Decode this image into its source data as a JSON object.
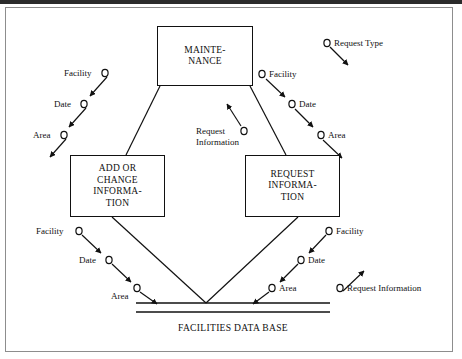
{
  "diagram": {
    "title_text": "FACILITIES DATA BASE",
    "processes": [
      {
        "id": "maintenance",
        "lines": [
          "MAINTE-",
          "NANCE"
        ]
      },
      {
        "id": "add_or_change",
        "lines": [
          "ADD OR",
          "CHANGE",
          "INFORMA-",
          "TION"
        ]
      },
      {
        "id": "request_info",
        "lines": [
          "REQUEST",
          "INFORMA-",
          "TION"
        ]
      }
    ],
    "datastore": {
      "label": "FACILITIES DATA BASE"
    },
    "flows": {
      "top_left": [
        {
          "label": "Facility"
        },
        {
          "label": "Date"
        },
        {
          "label": "Area"
        }
      ],
      "top_right": [
        {
          "label": "Facility"
        },
        {
          "label": "Date"
        },
        {
          "label": "Area"
        }
      ],
      "center": [
        {
          "label_line1": "Request",
          "label_line2": "Information"
        }
      ],
      "top_far_right": [
        {
          "label": "Request Type"
        }
      ],
      "bottom_left": [
        {
          "label": "Facility"
        },
        {
          "label": "Date"
        },
        {
          "label": "Area"
        }
      ],
      "bottom_right": [
        {
          "label": "Facility"
        },
        {
          "label": "Date"
        },
        {
          "label": "Area"
        },
        {
          "label": "Request Information"
        }
      ]
    },
    "colors": {
      "ink": "#111111",
      "paper": "#ffffff",
      "frame": "#8d8d8d",
      "scanbar": "#2b2b2b"
    }
  }
}
